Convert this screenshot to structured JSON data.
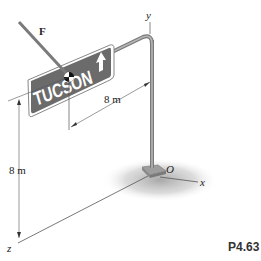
{
  "problem": {
    "id": "P4.63"
  },
  "labels": {
    "force": "F",
    "y_axis": "y",
    "x_axis": "x",
    "z_axis": "z",
    "origin": "O",
    "dim_horizontal": "8 m",
    "dim_vertical": "8 m"
  },
  "sign": {
    "text": "TUCSON",
    "arrow": "up-arrow",
    "background_color": "#6b6b6b",
    "text_color": "#ffffff"
  },
  "colors": {
    "pole": "#9a9a9a",
    "shadow": "#c8c8c8",
    "line": "#555555"
  }
}
